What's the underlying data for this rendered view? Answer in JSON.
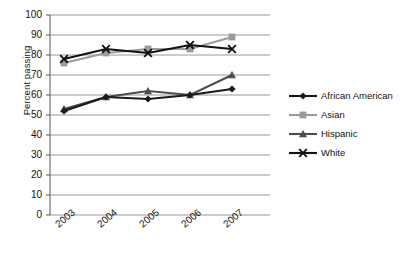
{
  "chart_data": {
    "type": "line",
    "title": "",
    "xlabel": "",
    "ylabel": "Percent passing",
    "categories": [
      "2003",
      "2004",
      "2005",
      "2006",
      "2007"
    ],
    "ylim": [
      0,
      100
    ],
    "yticks": [
      0,
      10,
      20,
      30,
      40,
      50,
      60,
      70,
      80,
      90,
      100
    ],
    "grid": true,
    "legend_position": "right",
    "series": [
      {
        "name": "African American",
        "color": "#1a1a1a",
        "marker": "diamond",
        "values": [
          52,
          59,
          58,
          60,
          63
        ]
      },
      {
        "name": "Asian",
        "color": "#9a9a9a",
        "marker": "square",
        "values": [
          76,
          81,
          83,
          83,
          89
        ]
      },
      {
        "name": "Hispanic",
        "color": "#4d4d4d",
        "marker": "triangle",
        "values": [
          53,
          59,
          62,
          60,
          70
        ]
      },
      {
        "name": "White",
        "color": "#111111",
        "marker": "x",
        "values": [
          78,
          83,
          81,
          85,
          83
        ]
      }
    ]
  },
  "axes": {
    "y_title": "Percent passing",
    "y_tick_labels": [
      "100",
      "90",
      "80",
      "70",
      "60",
      "50",
      "40",
      "30",
      "20",
      "10",
      "0"
    ],
    "x_tick_labels": [
      "2003",
      "2004",
      "2005",
      "2006",
      "2007"
    ]
  },
  "legend": {
    "entries": [
      {
        "label": "African American"
      },
      {
        "label": "Asian"
      },
      {
        "label": "Hispanic"
      },
      {
        "label": "White"
      }
    ]
  }
}
